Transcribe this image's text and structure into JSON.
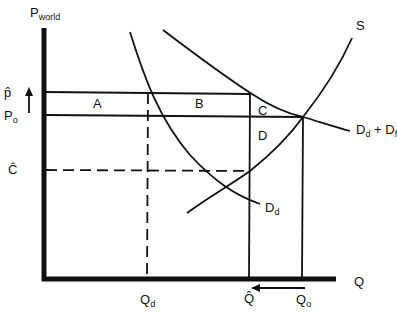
{
  "diagram": {
    "type": "economics supply-demand diagram",
    "axes": {
      "y_label": "P",
      "y_label_sub": "world",
      "x_label": "Q"
    },
    "price_labels": {
      "p_hat": "p̂",
      "p_o": "P",
      "p_o_sub": "o",
      "c_hat": "Ĉ"
    },
    "quantity_labels": {
      "q_d": "Q",
      "q_d_sub": "d",
      "q_hat": "Q̂",
      "q_o": "Q",
      "q_o_sub": "o"
    },
    "curve_labels": {
      "supply": "S",
      "total_demand": "D",
      "total_demand_sub1": "d",
      "total_demand_plus": " + D",
      "total_demand_sub2": "f",
      "domestic_demand": "D",
      "domestic_demand_sub": "d"
    },
    "region_labels": {
      "a": "A",
      "b": "B",
      "c": "C",
      "d": "D"
    },
    "colors": {
      "line": "#111111",
      "background": "#ffffff"
    }
  }
}
